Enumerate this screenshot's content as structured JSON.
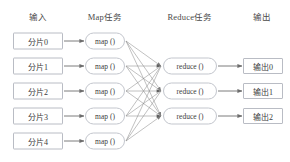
{
  "diagram": {
    "title_semantic": "mapreduce-dataflow",
    "width": 290,
    "height": 162,
    "colors": {
      "background": "#ffffff",
      "box_border": "#b9bcc4",
      "task_border": "#c3c6cd",
      "text": "#3c3c3c",
      "header_text": "#4a4a4a",
      "arrow": "#6d6d6d",
      "shuffle_line": "#8d8d8d"
    }
  },
  "headers": [
    {
      "label": "输入",
      "x": 38,
      "y": 16
    },
    {
      "label": "Map任务",
      "x": 105,
      "y": 16
    },
    {
      "label": "Reduce任务",
      "x": 190,
      "y": 16
    },
    {
      "label": "输出",
      "x": 262,
      "y": 16
    }
  ],
  "inputs": [
    {
      "label": "分片0",
      "x": 38,
      "y": 41
    },
    {
      "label": "分片1",
      "x": 38,
      "y": 66
    },
    {
      "label": "分片2",
      "x": 38,
      "y": 91
    },
    {
      "label": "分片3",
      "x": 38,
      "y": 116
    },
    {
      "label": "分片4",
      "x": 38,
      "y": 141
    }
  ],
  "map_tasks": [
    {
      "label": "map ()",
      "x": 105,
      "y": 41
    },
    {
      "label": "map ()",
      "x": 105,
      "y": 66
    },
    {
      "label": "map ()",
      "x": 105,
      "y": 91
    },
    {
      "label": "map ()",
      "x": 105,
      "y": 116
    },
    {
      "label": "map ()",
      "x": 105,
      "y": 141
    }
  ],
  "reduce_tasks": [
    {
      "label": "reduce ()",
      "x": 190,
      "y": 66
    },
    {
      "label": "reduce ()",
      "x": 190,
      "y": 91
    },
    {
      "label": "reduce ()",
      "x": 190,
      "y": 116
    }
  ],
  "outputs": [
    {
      "label": "输出0",
      "x": 263,
      "y": 66
    },
    {
      "label": "输出1",
      "x": 263,
      "y": 91
    },
    {
      "label": "输出2",
      "x": 263,
      "y": 116
    }
  ],
  "edges": {
    "input_to_map": [
      {
        "from": [
          64,
          41
        ],
        "to": [
          84,
          41
        ]
      },
      {
        "from": [
          64,
          66
        ],
        "to": [
          84,
          66
        ]
      },
      {
        "from": [
          64,
          91
        ],
        "to": [
          84,
          91
        ]
      },
      {
        "from": [
          64,
          116
        ],
        "to": [
          84,
          116
        ]
      },
      {
        "from": [
          64,
          141
        ],
        "to": [
          84,
          141
        ]
      }
    ],
    "shuffle_from": [
      [
        126,
        41
      ],
      [
        126,
        66
      ],
      [
        126,
        91
      ],
      [
        126,
        116
      ],
      [
        126,
        141
      ]
    ],
    "shuffle_to": [
      [
        161,
        66
      ],
      [
        161,
        91
      ],
      [
        161,
        116
      ]
    ],
    "reduce_to_output": [
      {
        "from": [
          218,
          66
        ],
        "to": [
          242,
          66
        ]
      },
      {
        "from": [
          218,
          91
        ],
        "to": [
          242,
          91
        ]
      },
      {
        "from": [
          218,
          116
        ],
        "to": [
          242,
          116
        ]
      }
    ]
  }
}
